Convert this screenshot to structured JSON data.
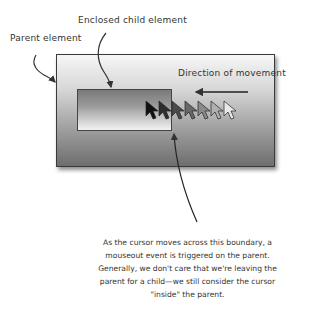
{
  "labels": {
    "parent": "Parent element",
    "child": "Enclosed child element",
    "direction": "Direction of movement"
  },
  "caption": {
    "lines": [
      "As the cursor moves across this boundary, a",
      "mouseout event is triggered on the parent.",
      "Generally, we don't care that we're leaving the",
      "parent for a child—we still consider the cursor",
      "\"inside\" the parent."
    ]
  },
  "cursors": {
    "count": 7,
    "colors": [
      "#111111",
      "#2e2e2e",
      "#4a4a4a",
      "#686868",
      "#8a8a8a",
      "#b0b0b0",
      "#e8e8e8"
    ]
  },
  "colors": {
    "stroke": "#333333",
    "parent_border": "#3a3a3a",
    "child_border": "#444444"
  }
}
